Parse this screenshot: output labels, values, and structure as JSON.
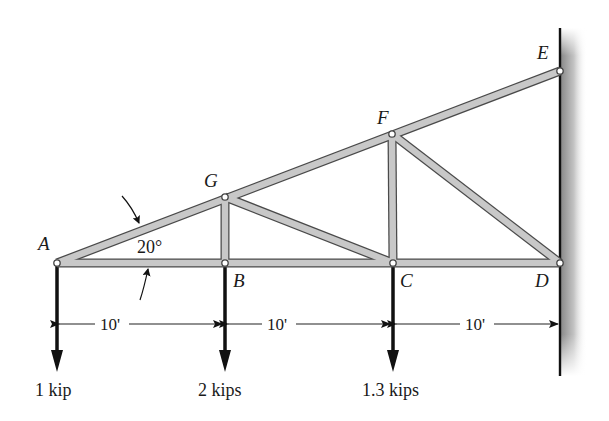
{
  "diagram": {
    "type": "roof-truss",
    "nodes": [
      {
        "id": "A",
        "label": "A",
        "x": 57,
        "y": 263
      },
      {
        "id": "B",
        "label": "B",
        "x": 225,
        "y": 263
      },
      {
        "id": "C",
        "label": "C",
        "x": 393,
        "y": 263
      },
      {
        "id": "D",
        "label": "D",
        "x": 560,
        "y": 263
      },
      {
        "id": "E",
        "label": "E",
        "x": 560,
        "y": 71
      },
      {
        "id": "F",
        "label": "F",
        "x": 392,
        "y": 134
      },
      {
        "id": "G",
        "label": "G",
        "x": 225,
        "y": 197
      }
    ],
    "members": [
      "AB",
      "BC",
      "CD",
      "AG",
      "GF",
      "FE",
      "GB",
      "GC",
      "FC",
      "FD"
    ],
    "angle": {
      "label": "20°",
      "at": "A"
    },
    "dimensions": [
      {
        "label": "10'",
        "from": "A",
        "to": "B"
      },
      {
        "label": "10'",
        "from": "B",
        "to": "C"
      },
      {
        "label": "10'",
        "from": "C",
        "to": "D"
      }
    ],
    "loads": [
      {
        "at": "A",
        "label": "1 kip"
      },
      {
        "at": "B",
        "label": "2 kips"
      },
      {
        "at": "C",
        "label": "1.3 kips"
      }
    ],
    "support": {
      "type": "wall",
      "side": "right"
    }
  }
}
